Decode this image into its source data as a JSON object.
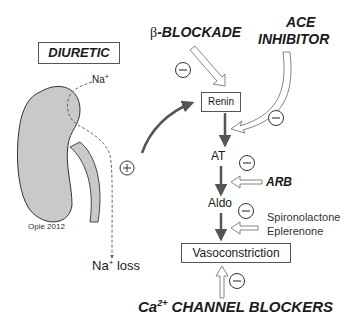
{
  "diagram": {
    "labels": {
      "diuretic": "DIURETIC",
      "beta_blockade_symbol": "β",
      "beta_blockade_text": "-BLOCKADE",
      "ace_line1": "ACE",
      "ace_line2": "INHIBITOR",
      "sodium_top": "Na",
      "sodium_top_sup": "+",
      "sodium_loss_na": "Na",
      "sodium_loss_sup": "+",
      "sodium_loss_text": " loss",
      "credit": "Opie 2012",
      "renin": "Renin",
      "at": "AT",
      "arb": "ARB",
      "aldo": "Aldo",
      "spironolactone": "Spironolactone",
      "eplerenone": "Eplerenone",
      "vasoconstriction": "Vasoconstriction",
      "ca_prefix": "Ca",
      "ca_sup": "2+",
      "ca_suffix": " CHANNEL BLOCKERS"
    },
    "symbols": {
      "inhibit": "−",
      "stimulate": "+"
    },
    "colors": {
      "kidney_fill": "#c9c9c9",
      "kidney_stroke": "#333333",
      "arrow_dark": "#555555",
      "text": "#1a1a1a"
    }
  }
}
